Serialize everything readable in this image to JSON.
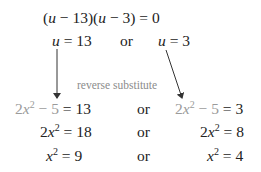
{
  "equations": {
    "factored": {
      "u1": "u",
      "part1": " − 13)(",
      "u2": "u",
      "part2": " − 3) = 0",
      "open": "("
    },
    "solutions": {
      "left": {
        "var": "u",
        "rhs": " = 13"
      },
      "or": "or",
      "right": {
        "var": "u",
        "rhs": " = 3"
      }
    },
    "annotation": "reverse substitute",
    "rows": [
      {
        "left": {
          "coef": "2",
          "var": "x",
          "exp": "2",
          "gray_tail": " − 5",
          "rhs": " = 13"
        },
        "or": "or",
        "right": {
          "coef": "2",
          "var": "x",
          "exp": "2",
          "gray_tail": " − 5",
          "rhs": " = 3"
        }
      },
      {
        "left": {
          "coef": "2",
          "var": "x",
          "exp": "2",
          "rhs": " = 18"
        },
        "or": "or",
        "right": {
          "coef": "2",
          "var": "x",
          "exp": "2",
          "rhs": " = 8"
        }
      },
      {
        "left": {
          "var": "x",
          "exp": "2",
          "rhs": " = 9"
        },
        "or": "or",
        "right": {
          "var": "x",
          "exp": "2",
          "rhs": " = 4"
        }
      }
    ]
  },
  "colors": {
    "text": "#222222",
    "substituted": "#9a9a9a",
    "annotation": "#8c8c8c"
  }
}
